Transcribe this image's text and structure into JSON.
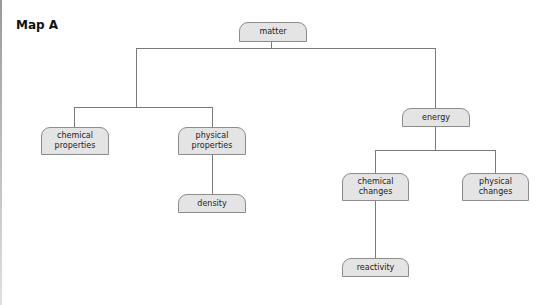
{
  "title": "Map A",
  "colors": {
    "node_fill": "#e4e4e4",
    "node_border": "#8c8c8c",
    "line": "#7a7a7a"
  },
  "nodes": {
    "matter": "matter",
    "chemical_properties": "chemical properties",
    "physical_properties": "physical properties",
    "density": "density",
    "energy": "energy",
    "chemical_changes": "chemical changes",
    "physical_changes": "physical changes",
    "reactivity": "reactivity"
  },
  "edges": [
    [
      "matter",
      "chemical_properties"
    ],
    [
      "matter",
      "physical_properties"
    ],
    [
      "matter",
      "energy"
    ],
    [
      "physical_properties",
      "density"
    ],
    [
      "energy",
      "chemical_changes"
    ],
    [
      "energy",
      "physical_changes"
    ],
    [
      "chemical_changes",
      "reactivity"
    ]
  ]
}
